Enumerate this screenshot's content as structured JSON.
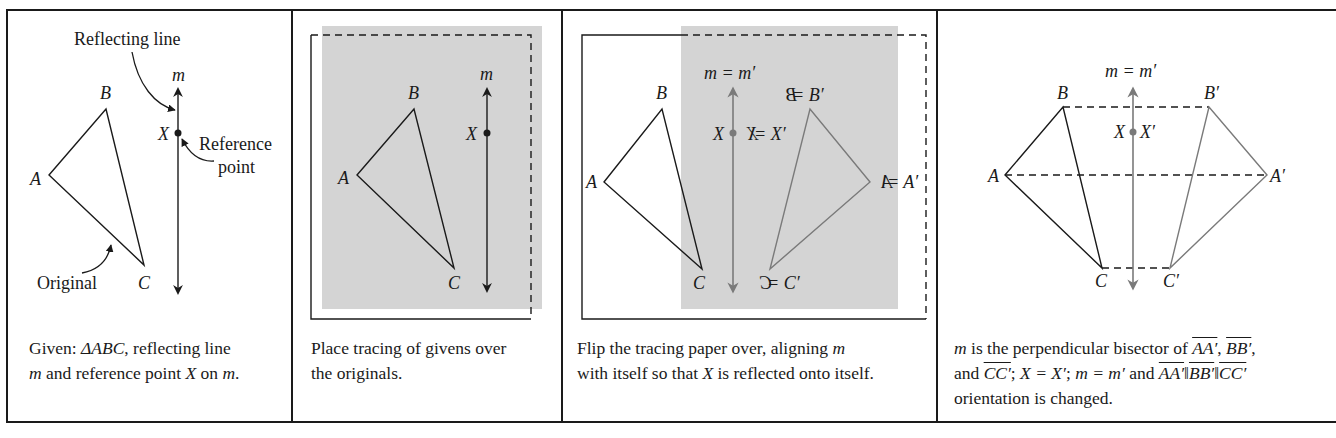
{
  "figure": {
    "panels": [
      {
        "id": "given",
        "labels": {
          "reflecting_line": "Reflecting line",
          "m": "m",
          "B": "B",
          "X": "X",
          "reference_line1": "Reference",
          "reference_line2": "point",
          "A": "A",
          "original": "Original",
          "C": "C"
        },
        "caption": {
          "line1_prefix": "Given: ",
          "line1_triangle": "ΔABC",
          "line1_suffix": ", reflecting line",
          "line2_m": "m",
          "line2_mid": " and reference point ",
          "line2_X": "X",
          "line2_on": " on ",
          "line2_m2": "m",
          "line2_end": "."
        }
      },
      {
        "id": "place-tracing",
        "labels": {
          "m": "m",
          "B": "B",
          "X": "X",
          "A": "A",
          "C": "C"
        },
        "caption": {
          "line1": "Place tracing of givens over",
          "line2": "the originals."
        }
      },
      {
        "id": "flip-tracing",
        "labels": {
          "m_eq": "m = m′",
          "B": "B",
          "X": "X",
          "A": "A",
          "C": "C",
          "B_prime": "B = B′",
          "X_prime": "X = X′",
          "A_prime": "A = A′",
          "C_prime": "C = C′",
          "mirror_B": "B",
          "mirror_X": "X",
          "mirror_A": "A",
          "mirror_C": "C"
        },
        "caption": {
          "line1_a": "Flip the tracing paper over, aligning ",
          "line1_m": "m",
          "line2_a": "with itself so that ",
          "line2_X": "X",
          "line2_b": " is reflected onto itself."
        }
      },
      {
        "id": "result",
        "labels": {
          "m_eq": "m = m′",
          "B": "B",
          "B_prime": "B′",
          "X": "X",
          "X_prime": "X′",
          "A": "A",
          "A_prime": "A′",
          "C": "C",
          "C_prime": "C′"
        },
        "caption": {
          "line1_m": "m",
          "line1_a": " is the perpendicular bisector of ",
          "seg_AA": "AA′",
          "sep1": ", ",
          "seg_BB": "BB′",
          "sep2": ",",
          "line2_and": "and ",
          "seg_CC": "CC′",
          "line2_b": "; ",
          "line2_X": "X = X′",
          "line2_c": "; ",
          "line2_m": "m = m′",
          "line2_d": " and ",
          "seg_AA2": "AA′",
          "par1": "‖",
          "seg_BB2": "BB′",
          "par2": "‖",
          "seg_CC2": "CC′",
          "line3": "orientation is changed."
        }
      }
    ],
    "colors": {
      "ink": "#1a1a1a",
      "tracing_gray": "#7a7a7a",
      "paper_shade": "#d4d4d4"
    }
  }
}
